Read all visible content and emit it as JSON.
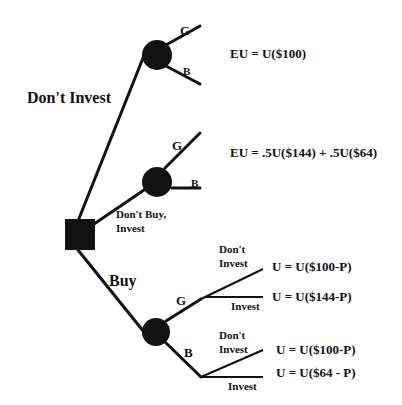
{
  "diagram": {
    "type": "decision-tree",
    "colors": {
      "ink": "#111111",
      "background": "#ffffff"
    },
    "decision_node": {
      "shape": "square",
      "label": ""
    },
    "branches": {
      "dont_invest": {
        "label": "Don't Invest"
      },
      "dont_buy_invest": {
        "label_line1": "Don't Buy,",
        "label_line2": "Invest"
      },
      "buy": {
        "label": "Buy"
      }
    },
    "chance_nodes": {
      "top": {
        "good": "G",
        "bad": "B",
        "outcome": "EU = U($100)"
      },
      "middle": {
        "good": "G",
        "bad": "B",
        "outcome": "EU = .5U($144) + .5U($64)"
      },
      "bottom": {
        "good": "G",
        "bad": "B",
        "good_branch": {
          "dont_invest_line1": "Don't",
          "dont_invest_line2": "Invest",
          "dont_invest_outcome": "U = U($100-P)",
          "invest_label": "Invest",
          "invest_outcome": "U = U($144-P)"
        },
        "bad_branch": {
          "dont_invest_line1": "Don't",
          "dont_invest_line2": "Invest",
          "dont_invest_outcome": "U = U($100-P)",
          "invest_label": "Invest",
          "invest_outcome": "U = U($64 - P)"
        }
      }
    }
  }
}
